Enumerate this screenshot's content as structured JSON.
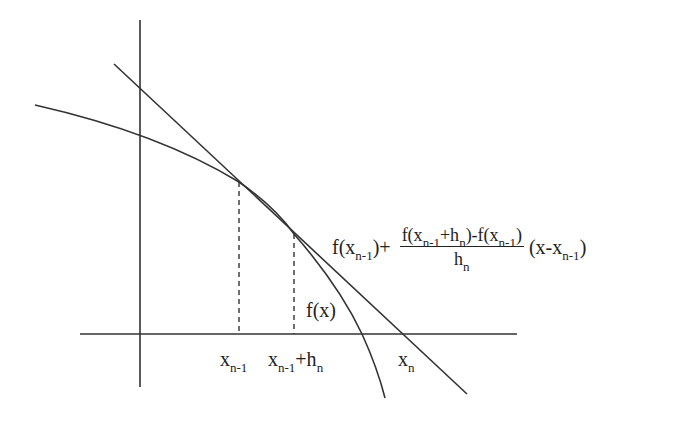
{
  "diagram": {
    "colors": {
      "line": "#333333",
      "text": "#222222",
      "background": "#ffffff"
    },
    "axes": {
      "vertical": {
        "x": 140,
        "y1": 20,
        "y2": 387
      },
      "horizontal": {
        "y": 334,
        "x1": 80,
        "x2": 517
      }
    },
    "curve": {
      "label": "f(x)",
      "points": [
        [
          35,
          105
        ],
        [
          140,
          134
        ],
        [
          239,
          182
        ],
        [
          294,
          234
        ],
        [
          330,
          275
        ],
        [
          362,
          334
        ],
        [
          385,
          398
        ]
      ]
    },
    "secant_line": {
      "x1": 114,
      "y1": 64,
      "x2": 467,
      "y2": 394
    },
    "dashed_guides": [
      {
        "x": 239,
        "y_top": 182,
        "y_bottom": 334
      },
      {
        "x": 294,
        "y_top": 234,
        "y_bottom": 334
      }
    ],
    "labels": {
      "curve": {
        "base": "f(x)"
      },
      "x_prev": {
        "base": "x",
        "sub": "n-1"
      },
      "x_prev_h": {
        "base": "x",
        "sub": "n-1",
        "suffix": "+h",
        "suffix_sub": "n"
      },
      "x_n": {
        "base": "x",
        "sub": "n"
      },
      "formula": {
        "prefix_base": "f(x",
        "prefix_sub": "n-1",
        "prefix_tail": ")+",
        "numerator": {
          "p1": "f(x",
          "s1": "n-1",
          "p2": "+h",
          "s2": "n",
          "p3": ")-f(x",
          "s3": "n-1",
          "p4": ")"
        },
        "denominator": {
          "base": "h",
          "sub": "n"
        },
        "suffix_base": "(x-x",
        "suffix_sub": "n-1",
        "suffix_tail": ")"
      }
    }
  }
}
